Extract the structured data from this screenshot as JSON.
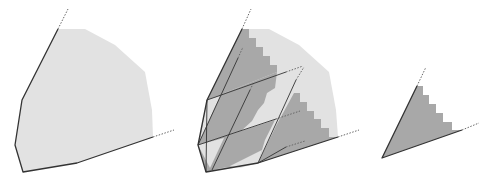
{
  "figure": {
    "width": 495,
    "height": 182,
    "colors": {
      "light_fill": "#e2e2e2",
      "dark_fill": "#a8a8a8",
      "stroke": "#333333",
      "dotted": "#666666"
    },
    "panels": [
      {
        "name": "convex-region",
        "light_polygon": "58,29 85,29 115,45 145,72 152,110 153,137 77,163 23,172 15,145 22,100",
        "solid_outline": "58,29 22,100 15,145 23,172 77,163 153,137",
        "dotted_rays": [
          {
            "x1": 58,
            "y1": 29,
            "x2": 68,
            "y2": 9
          },
          {
            "x1": 153,
            "y1": 137,
            "x2": 174,
            "y2": 130
          }
        ]
      },
      {
        "name": "decomposed-region",
        "light_polygon": "242,29 269,29 299,45 329,72 336,110 338,137 258,163 206,172 198,145 207,100",
        "dark_polygons": [
          "242,29 249,29 249,38 256,38 256,47 263,47 263,56 270,56 270,65 277,65 277,72 207,100",
          "294,93 300,93 300,102 307,102 307,111 314,111 314,119 321,119 321,128 329,128 329,137 338,137 258,163 277,124",
          "207,100 277,72 275,88 267,93 264,103 258,110 252,121 241,131 198,145",
          "198,145 275,120 265,140 262,150 258,163 222,168 206,172",
          "212,100 200,140 206,110"
        ],
        "light_triangles": [
          "207,100 220,96 200,140",
          "198,145 224,138 210,168",
          "240,168 258,163 262,150 230,166"
        ],
        "solid_outline": "242,29 207,100 198,145 206,172 258,163 338,137",
        "inner_solid_lines": [
          {
            "x1": 207,
            "y1": 100,
            "x2": 286,
            "y2": 72
          },
          {
            "x1": 198,
            "y1": 145,
            "x2": 276,
            "y2": 119
          },
          {
            "x1": 258,
            "y1": 163,
            "x2": 286,
            "y2": 147
          },
          {
            "x1": 198,
            "y1": 145,
            "x2": 238,
            "y2": 58
          },
          {
            "x1": 212,
            "y1": 170,
            "x2": 250,
            "y2": 90
          },
          {
            "x1": 258,
            "y1": 163,
            "x2": 296,
            "y2": 80
          },
          {
            "x1": 207,
            "y1": 100,
            "x2": 206,
            "y2": 172
          }
        ],
        "dotted_rays": [
          {
            "x1": 242,
            "y1": 29,
            "x2": 251,
            "y2": 9
          },
          {
            "x1": 338,
            "y1": 137,
            "x2": 359,
            "y2": 130
          },
          {
            "x1": 286,
            "y1": 72,
            "x2": 303,
            "y2": 66
          },
          {
            "x1": 276,
            "y1": 119,
            "x2": 300,
            "y2": 111
          },
          {
            "x1": 286,
            "y1": 147,
            "x2": 305,
            "y2": 141
          },
          {
            "x1": 238,
            "y1": 58,
            "x2": 243,
            "y2": 47
          },
          {
            "x1": 250,
            "y1": 90,
            "x2": 253,
            "y2": 84
          },
          {
            "x1": 296,
            "y1": 80,
            "x2": 304,
            "y2": 67
          }
        ]
      },
      {
        "name": "staircase-cone",
        "dark_polygon": "417,86 423,86 423,95 429,95 429,104 436,104 436,113 443,113 443,122 452,122 452,130 462,130 382,158",
        "solid_outline": "417,86 382,158 462,130",
        "dotted_rays": [
          {
            "x1": 417,
            "y1": 86,
            "x2": 426,
            "y2": 67
          },
          {
            "x1": 462,
            "y1": 130,
            "x2": 479,
            "y2": 123
          }
        ]
      }
    ]
  }
}
